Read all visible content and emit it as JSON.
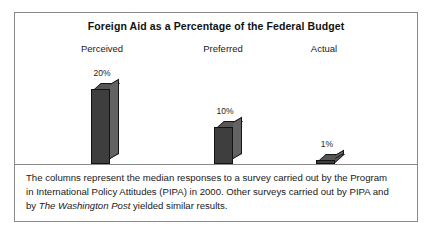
{
  "figure": {
    "title": "Foreign Aid as a Percentage of the Federal Budget",
    "border_color": "#8a8a8a"
  },
  "chart_data": {
    "type": "bar",
    "title": "Foreign Aid as a Percentage of the Federal Budget",
    "categories": [
      "Perceived",
      "Preferred",
      "Actual"
    ],
    "values": [
      20,
      10,
      1
    ],
    "value_labels": [
      "20%",
      "10%",
      "1%"
    ],
    "xlabel": "",
    "ylabel": "",
    "ylim": [
      0,
      20
    ],
    "grid": false,
    "legend": "none",
    "style": "3d-columns",
    "bar_color": "#3e3e3e",
    "bar_side_color": "#636363",
    "bar_top_color": "#565656"
  },
  "caption": {
    "line1": "The columns represent the median responses to a survey carried out by the Program",
    "line2": "in International Policy Attitudes (PIPA) in 2000. Other surveys carried out by PIPA and",
    "line3_prefix": "by ",
    "line3_italic": "The Washington Post",
    "line3_suffix": " yielded similar results."
  }
}
